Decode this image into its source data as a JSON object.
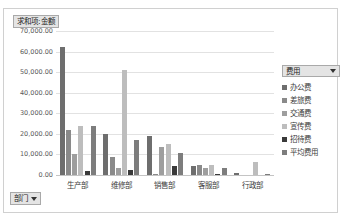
{
  "sheet_strip": "",
  "value_field": {
    "label": "求和项:金额",
    "icon": "chevron-down-icon"
  },
  "dept_field": {
    "label": "部门",
    "icon": "chevron-down-icon"
  },
  "legend": {
    "header": "费用",
    "header_icon": "chevron-down-icon",
    "items": [
      {
        "label": "办公费",
        "color": "#6e6e6e"
      },
      {
        "label": "差旅费",
        "color": "#8a8a8a"
      },
      {
        "label": "交通费",
        "color": "#9e9e9e"
      },
      {
        "label": "宣传费",
        "color": "#bdbdbd"
      },
      {
        "label": "招待费",
        "color": "#3a3a3a"
      },
      {
        "label": "平均费用",
        "color": "#7d7d7d"
      }
    ]
  },
  "chart_data": {
    "type": "bar",
    "title": "求和项:金额",
    "xlabel": "部门",
    "ylabel": "",
    "ylim": [
      0,
      70000
    ],
    "ytick_step": 10000,
    "ytick_labels": [
      "70,000.00",
      "60,000.00",
      "50,000.00",
      "40,000.00",
      "30,000.00",
      "20,000.00",
      "10,000.00",
      "0.00"
    ],
    "grid": true,
    "legend_position": "right",
    "categories": [
      "生产部",
      "维修部",
      "销售部",
      "客服部",
      "行政部"
    ],
    "series": [
      {
        "name": "办公费",
        "color": "#6e6e6e",
        "values": [
          62000,
          19900,
          18800,
          4200,
          900
        ]
      },
      {
        "name": "差旅费",
        "color": "#8a8a8a",
        "values": [
          21800,
          8800,
          600,
          4800,
          0
        ]
      },
      {
        "name": "交通费",
        "color": "#9e9e9e",
        "values": [
          10200,
          3300,
          13400,
          3200,
          0
        ]
      },
      {
        "name": "宣传费",
        "color": "#bdbdbd",
        "values": [
          23900,
          51000,
          15200,
          5100,
          6100
        ]
      },
      {
        "name": "招待费",
        "color": "#3a3a3a",
        "values": [
          1800,
          2200,
          4200,
          300,
          0
        ]
      },
      {
        "name": "平均费用",
        "color": "#7d7d7d",
        "values": [
          23800,
          17000,
          10700,
          3400,
          700
        ]
      }
    ]
  }
}
